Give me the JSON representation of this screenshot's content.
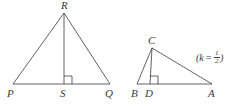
{
  "figure": {
    "type": "geometry-diagram",
    "background_color": "#ffffff",
    "stroke_color": "#3a3a3a",
    "label_color": "#3a3a3a",
    "left_triangle": {
      "name": "triangle-PQR",
      "vertices": [
        {
          "id": "R",
          "label": "R",
          "x": 64,
          "y": 13
        },
        {
          "id": "P",
          "label": "P",
          "x": 13,
          "y": 84
        },
        {
          "id": "Q",
          "label": "Q",
          "x": 110,
          "y": 84
        }
      ],
      "altitude": {
        "from": "R",
        "foot": {
          "id": "S",
          "label": "S",
          "x": 64,
          "y": 84
        },
        "right_angle_mark": true
      },
      "labels": {
        "apex": "R",
        "base_left": "P",
        "base_foot": "S",
        "base_right": "Q"
      }
    },
    "right_triangle": {
      "name": "triangle-ABC",
      "vertices": [
        {
          "id": "C",
          "label": "C",
          "x": 152,
          "y": 48
        },
        {
          "id": "B",
          "label": "B",
          "x": 137,
          "y": 84
        },
        {
          "id": "A",
          "label": "A",
          "x": 212,
          "y": 84
        }
      ],
      "altitude": {
        "from": "C",
        "foot": {
          "id": "D",
          "label": "D",
          "x": 150,
          "y": 84
        },
        "right_angle_mark": true
      },
      "labels": {
        "apex": "C",
        "base_left": "B",
        "base_foot": "D",
        "base_right": "A"
      }
    },
    "annotation": {
      "name": "scale-factor",
      "open_paren": "(",
      "variable": "k",
      "equals": "=",
      "fraction_numerator": "1",
      "fraction_denominator": "2",
      "close_paren": ")",
      "plain_text": "(k = 1/2)"
    }
  }
}
